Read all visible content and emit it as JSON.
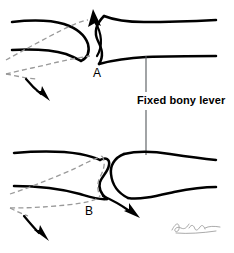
{
  "figure": {
    "background_color": "#ffffff",
    "width": 234,
    "height": 253
  },
  "labels": {
    "callout": "Fixed bony lever",
    "panel_a": "A",
    "panel_b": "B"
  },
  "panels": [
    {
      "id": "A",
      "letter": "A",
      "description": "Upper joint: rounded bone head at left seats against concave fixed bony lever at right; gray dashed outline shows displaced position of the mobile bone.",
      "solid_bone_left": "rounded-head-long-bone",
      "solid_bone_right": "fixed-bony-lever-concave",
      "ghost_bone": "displaced-mobile-bone",
      "arrows": [
        {
          "name": "upward-rotation-arrow",
          "direction": "up-left",
          "meaning": "head levers upward over fulcrum"
        },
        {
          "name": "downward-shaft-arrow",
          "direction": "down-left",
          "meaning": "distal shaft swings downward"
        }
      ]
    },
    {
      "id": "B",
      "letter": "B",
      "description": "Lower joint: concave socket bone at left meets rounded fixed bony lever head at right; gray dashed outline shows displaced position of the mobile bone.",
      "solid_bone_left": "concave-socket-long-bone",
      "solid_bone_right": "fixed-bony-lever-rounded-head",
      "ghost_bone": "displaced-mobile-bone",
      "arrows": [
        {
          "name": "downward-joint-arrow",
          "direction": "down-right",
          "meaning": "head displaces downward out of socket"
        },
        {
          "name": "downward-shaft-arrow",
          "direction": "down-left",
          "meaning": "distal shaft swings downward"
        }
      ]
    }
  ],
  "callout": {
    "text": "Fixed bony lever",
    "leader_to_panel_a": true,
    "leader_to_panel_b": true
  },
  "signature": {
    "present": true,
    "style": "cursive artist signature",
    "color": "#9b9b9b"
  },
  "colors": {
    "bone_stroke": "#000000",
    "ghost_stroke": "#9a9a9a",
    "leader_stroke": "#55585c",
    "label_text": "#000000",
    "background": "#ffffff"
  }
}
